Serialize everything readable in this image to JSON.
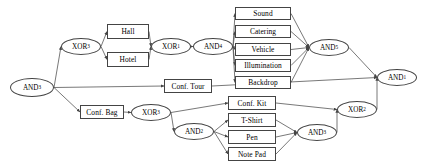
{
  "diagram": {
    "type": "process-model-graph",
    "title": "",
    "style": {
      "edge_color": "#555555",
      "node_border": "#444444",
      "node_fill": "#ffffff",
      "text_color": "#000000"
    },
    "nodes": [
      {
        "id": "and3",
        "kind": "connector",
        "shape": "ellipse",
        "label": "AND",
        "sub": "3",
        "x": 10,
        "y": 78,
        "w": 44,
        "h": 19
      },
      {
        "id": "xor3a",
        "kind": "connector",
        "shape": "ellipse",
        "label": "XOR",
        "sub": "3",
        "x": 61,
        "y": 38,
        "w": 40,
        "h": 17
      },
      {
        "id": "hall",
        "kind": "activity",
        "shape": "rectangle",
        "label": "Hall",
        "sub": "",
        "x": 107,
        "y": 24,
        "w": 42,
        "h": 15
      },
      {
        "id": "hotel",
        "kind": "activity",
        "shape": "rectangle",
        "label": "Hotel",
        "sub": "",
        "x": 107,
        "y": 52,
        "w": 42,
        "h": 15
      },
      {
        "id": "xor1",
        "kind": "connector",
        "shape": "ellipse",
        "label": "XOR",
        "sub": "1",
        "x": 151,
        "y": 38,
        "w": 40,
        "h": 17
      },
      {
        "id": "and4",
        "kind": "connector",
        "shape": "ellipse",
        "label": "AND",
        "sub": "4",
        "x": 193,
        "y": 38,
        "w": 40,
        "h": 17
      },
      {
        "id": "sound",
        "kind": "activity",
        "shape": "rectangle",
        "label": "Sound",
        "sub": "",
        "x": 235,
        "y": 7,
        "w": 56,
        "h": 13
      },
      {
        "id": "cater",
        "kind": "activity",
        "shape": "rectangle",
        "label": "Catering",
        "sub": "",
        "x": 235,
        "y": 25,
        "w": 56,
        "h": 13
      },
      {
        "id": "vehic",
        "kind": "activity",
        "shape": "rectangle",
        "label": "Vehicle",
        "sub": "",
        "x": 235,
        "y": 43,
        "w": 56,
        "h": 13
      },
      {
        "id": "illum",
        "kind": "activity",
        "shape": "rectangle",
        "label": "Illumination",
        "sub": "",
        "x": 235,
        "y": 59,
        "w": 56,
        "h": 13
      },
      {
        "id": "backd",
        "kind": "activity",
        "shape": "rectangle",
        "label": "Backdrop",
        "sub": "",
        "x": 235,
        "y": 76,
        "w": 56,
        "h": 13
      },
      {
        "id": "and5",
        "kind": "connector",
        "shape": "ellipse",
        "label": "AND",
        "sub": "5",
        "x": 309,
        "y": 39,
        "w": 40,
        "h": 17
      },
      {
        "id": "ctour",
        "kind": "activity",
        "shape": "rectangle",
        "label": "Conf. Tour",
        "sub": "",
        "x": 164,
        "y": 79,
        "w": 48,
        "h": 14
      },
      {
        "id": "cbag",
        "kind": "activity",
        "shape": "rectangle",
        "label": "Conf. Bag",
        "sub": "",
        "x": 80,
        "y": 105,
        "w": 44,
        "h": 14
      },
      {
        "id": "xor3b",
        "kind": "connector",
        "shape": "ellipse",
        "label": "XOR",
        "sub": "3",
        "x": 131,
        "y": 104,
        "w": 40,
        "h": 17
      },
      {
        "id": "ckit",
        "kind": "activity",
        "shape": "rectangle",
        "label": "Conf. Kit",
        "sub": "",
        "x": 228,
        "y": 96,
        "w": 48,
        "h": 14
      },
      {
        "id": "and2",
        "kind": "connector",
        "shape": "ellipse",
        "label": "AND",
        "sub": "2",
        "x": 174,
        "y": 123,
        "w": 40,
        "h": 17
      },
      {
        "id": "tshirt",
        "kind": "activity",
        "shape": "rectangle",
        "label": "T-Shirt",
        "sub": "",
        "x": 228,
        "y": 113,
        "w": 48,
        "h": 14
      },
      {
        "id": "pen",
        "kind": "activity",
        "shape": "rectangle",
        "label": "Pen",
        "sub": "",
        "x": 228,
        "y": 130,
        "w": 48,
        "h": 14
      },
      {
        "id": "notep",
        "kind": "activity",
        "shape": "rectangle",
        "label": "Note Pad",
        "sub": "",
        "x": 228,
        "y": 147,
        "w": 48,
        "h": 14
      },
      {
        "id": "and3b",
        "kind": "connector",
        "shape": "ellipse",
        "label": "AND",
        "sub": "3",
        "x": 297,
        "y": 124,
        "w": 40,
        "h": 17
      },
      {
        "id": "xor2",
        "kind": "connector",
        "shape": "ellipse",
        "label": "XOR",
        "sub": "2",
        "x": 337,
        "y": 101,
        "w": 40,
        "h": 17
      },
      {
        "id": "and1",
        "kind": "connector",
        "shape": "ellipse",
        "label": "AND",
        "sub": "1",
        "x": 377,
        "y": 69,
        "w": 40,
        "h": 17
      }
    ],
    "edges": [
      {
        "from": "and3",
        "to": "xor3a"
      },
      {
        "from": "and3",
        "to": "ctour"
      },
      {
        "from": "and3",
        "to": "cbag"
      },
      {
        "from": "xor3a",
        "to": "hall"
      },
      {
        "from": "xor3a",
        "to": "hotel"
      },
      {
        "from": "hall",
        "to": "xor1"
      },
      {
        "from": "hotel",
        "to": "xor1"
      },
      {
        "from": "xor1",
        "to": "and4"
      },
      {
        "from": "and4",
        "to": "sound"
      },
      {
        "from": "and4",
        "to": "cater"
      },
      {
        "from": "and4",
        "to": "vehic"
      },
      {
        "from": "and4",
        "to": "illum"
      },
      {
        "from": "and4",
        "to": "backd"
      },
      {
        "from": "sound",
        "to": "and5"
      },
      {
        "from": "cater",
        "to": "and5"
      },
      {
        "from": "vehic",
        "to": "and5"
      },
      {
        "from": "illum",
        "to": "and5"
      },
      {
        "from": "backd",
        "to": "and5"
      },
      {
        "from": "and5",
        "to": "and1"
      },
      {
        "from": "ctour",
        "to": "and1"
      },
      {
        "from": "cbag",
        "to": "xor3b"
      },
      {
        "from": "xor3b",
        "to": "ckit"
      },
      {
        "from": "xor3b",
        "to": "and2"
      },
      {
        "from": "and2",
        "to": "tshirt"
      },
      {
        "from": "and2",
        "to": "pen"
      },
      {
        "from": "and2",
        "to": "notep"
      },
      {
        "from": "tshirt",
        "to": "and3b"
      },
      {
        "from": "pen",
        "to": "and3b"
      },
      {
        "from": "notep",
        "to": "and3b"
      },
      {
        "from": "ckit",
        "to": "xor2"
      },
      {
        "from": "and3b",
        "to": "xor2"
      },
      {
        "from": "xor2",
        "to": "and1"
      }
    ]
  }
}
